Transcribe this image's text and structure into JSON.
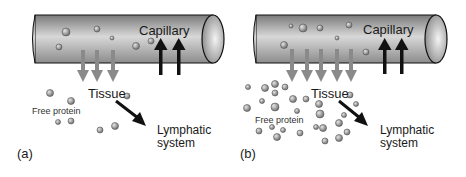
{
  "panels": [
    {
      "id": "a",
      "panel_label": "(a)",
      "capillary_label": "Capillary",
      "tissue_label": "Tissue",
      "free_protein_label": "Free protein",
      "lymphatic_label_line1": "Lymphatic",
      "lymphatic_label_line2": "system",
      "outflow_arrows": 3,
      "reabsorption_arrows": 2
    },
    {
      "id": "b",
      "panel_label": "(b)",
      "capillary_label": "Capillary",
      "tissue_label": "Tissue",
      "free_protein_label": "Free protein",
      "lymphatic_label_line1": "Lymphatic",
      "lymphatic_label_line2": "system",
      "outflow_arrows": 5,
      "reabsorption_arrows": 2
    }
  ],
  "colors": {
    "cylinder_dark": "#6e6e6e",
    "cylinder_light": "#d9d9d9",
    "outflow_arrow": "#8a8a8a",
    "reabsorption_arrow": "#111111",
    "protein": "#9a9a9a"
  }
}
